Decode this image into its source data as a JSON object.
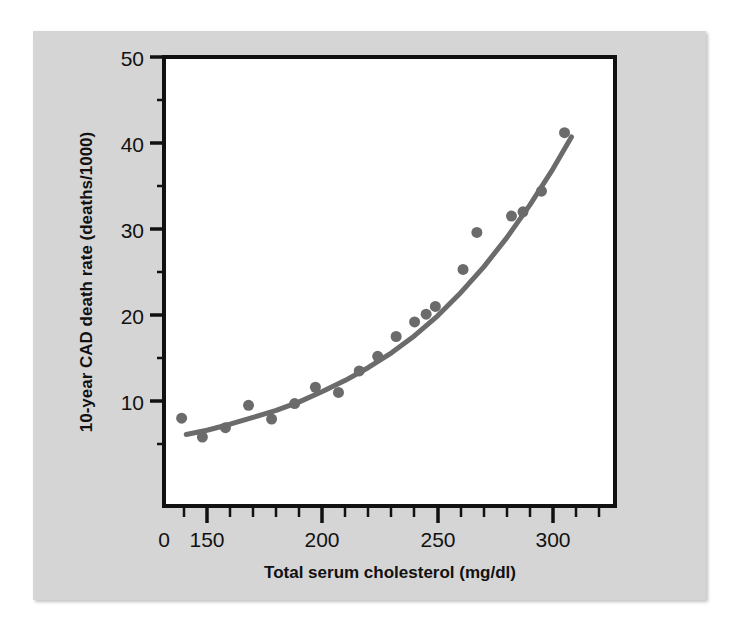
{
  "figure": {
    "panel_background": "#d5d5d5",
    "plot_background": "#ffffff",
    "axis_color": "#111111",
    "marker_color": "#6b6b6b",
    "curve_color": "#6b6b6b"
  },
  "chart_data": {
    "type": "scatter",
    "title": "",
    "subtitle": "",
    "xlabel": "Total serum cholesterol (mg/dl)",
    "ylabel": "10-year CAD death rate (deaths/1000)",
    "xlim": [
      130,
      315
    ],
    "ylim": [
      0,
      50
    ],
    "x_axis_break": true,
    "x_axis_break_note": "axis origin labelled 0, then resumes at 150",
    "xticks": [
      0,
      150,
      200,
      250,
      300
    ],
    "xtick_labels": [
      "0",
      "150",
      "200",
      "250",
      "300"
    ],
    "x_minor_tick_step": 10,
    "yticks": [
      10,
      20,
      30,
      40,
      50
    ],
    "ytick_labels": [
      "10",
      "20",
      "30",
      "40",
      "50"
    ],
    "grid": false,
    "legend": "none",
    "marker_shape": "circle",
    "marker_size_px": 11,
    "points": [
      {
        "x": 139,
        "y": 8.0
      },
      {
        "x": 148,
        "y": 5.8
      },
      {
        "x": 158,
        "y": 6.9
      },
      {
        "x": 168,
        "y": 9.5
      },
      {
        "x": 178,
        "y": 7.9
      },
      {
        "x": 188,
        "y": 9.7
      },
      {
        "x": 197,
        "y": 11.6
      },
      {
        "x": 207,
        "y": 11.0
      },
      {
        "x": 216,
        "y": 13.5
      },
      {
        "x": 224,
        "y": 15.2
      },
      {
        "x": 232,
        "y": 17.5
      },
      {
        "x": 240,
        "y": 19.2
      },
      {
        "x": 245,
        "y": 20.1
      },
      {
        "x": 249,
        "y": 21.0
      },
      {
        "x": 261,
        "y": 25.3
      },
      {
        "x": 267,
        "y": 29.6
      },
      {
        "x": 282,
        "y": 31.5
      },
      {
        "x": 287,
        "y": 32.0
      },
      {
        "x": 295,
        "y": 34.4
      },
      {
        "x": 305,
        "y": 41.2
      }
    ],
    "fit_curve": {
      "kind": "smooth-trend",
      "points": [
        {
          "x": 141,
          "y": 6.1
        },
        {
          "x": 150,
          "y": 6.6
        },
        {
          "x": 160,
          "y": 7.3
        },
        {
          "x": 170,
          "y": 8.1
        },
        {
          "x": 180,
          "y": 8.9
        },
        {
          "x": 190,
          "y": 9.9
        },
        {
          "x": 200,
          "y": 11.1
        },
        {
          "x": 210,
          "y": 12.4
        },
        {
          "x": 220,
          "y": 13.9
        },
        {
          "x": 230,
          "y": 15.6
        },
        {
          "x": 240,
          "y": 17.6
        },
        {
          "x": 250,
          "y": 19.9
        },
        {
          "x": 260,
          "y": 22.6
        },
        {
          "x": 270,
          "y": 25.6
        },
        {
          "x": 280,
          "y": 29.0
        },
        {
          "x": 290,
          "y": 32.8
        },
        {
          "x": 300,
          "y": 37.0
        },
        {
          "x": 308,
          "y": 40.7
        }
      ]
    }
  }
}
